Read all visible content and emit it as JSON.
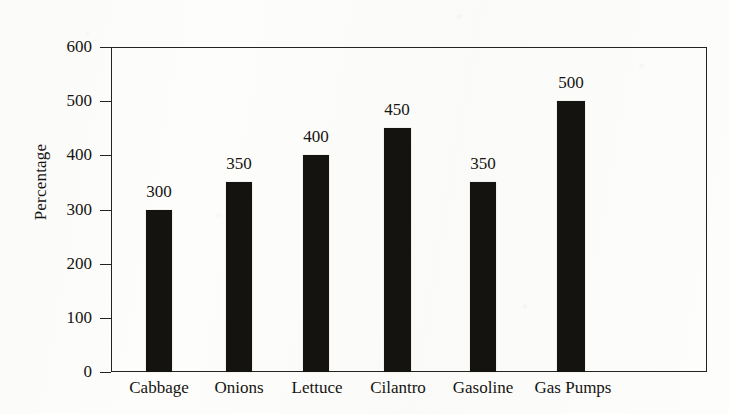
{
  "chart_data": {
    "type": "bar",
    "title": "",
    "xlabel": "",
    "ylabel": "Percentage",
    "categories": [
      "Cabbage",
      "Onions",
      "Lettuce",
      "Cilantro",
      "Gasoline",
      "Gas Pumps"
    ],
    "values": [
      300,
      350,
      400,
      450,
      350,
      500
    ],
    "value_labels": [
      "300",
      "350",
      "400",
      "450",
      "350",
      "500"
    ],
    "ylim": [
      0,
      600
    ],
    "ytick_values": [
      0,
      100,
      200,
      300,
      400,
      500,
      600
    ],
    "ytick_labels": [
      "0",
      "100",
      "200",
      "300",
      "400",
      "500",
      "600"
    ],
    "grid": false,
    "legend": false,
    "legend_position": "none",
    "bar_color": "#15130f",
    "axis_color": "#232320",
    "background_color": "#fdfdfc",
    "text_color": "#15140f"
  }
}
